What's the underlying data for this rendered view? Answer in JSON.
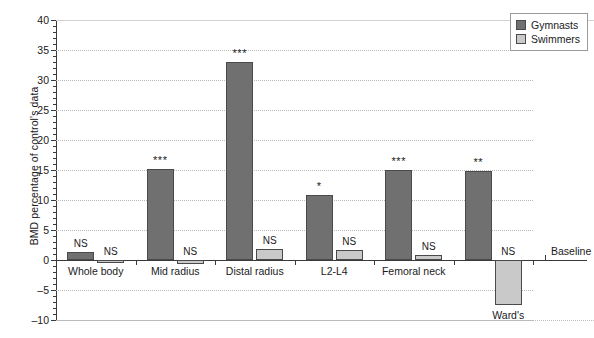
{
  "chart_data": {
    "type": "bar",
    "title": "",
    "xlabel": "",
    "ylabel": "BMD percentage of control's data",
    "ylim": [
      -10,
      40
    ],
    "ytick_step": 5,
    "yticks": [
      40,
      35,
      30,
      25,
      20,
      15,
      10,
      5,
      0,
      -5,
      -10
    ],
    "ytick_labels": [
      "40",
      "35",
      "30",
      "25",
      "20",
      "15",
      "10",
      "5",
      "0",
      "–5",
      "–10"
    ],
    "grid": true,
    "legend_position": "top-right",
    "baseline_label": "Baseline",
    "baseline_value": 0,
    "categories": [
      "Whole body",
      "Mid radius",
      "Distal radius",
      "L2-L4",
      "Femoral neck",
      "Ward's"
    ],
    "series": [
      {
        "name": "Gymnasts",
        "color": "#707070",
        "values": [
          1.3,
          15.2,
          33.0,
          10.9,
          15.0,
          14.8
        ],
        "annotations": [
          "NS",
          "***",
          "***",
          "*",
          "***",
          "**"
        ]
      },
      {
        "name": "Swimmers",
        "color": "#c9c9c9",
        "values": [
          -0.5,
          -0.6,
          1.8,
          1.6,
          0.9,
          -7.5
        ],
        "annotations": [
          "NS",
          "NS",
          "NS",
          "NS",
          "NS",
          "NS"
        ]
      }
    ]
  },
  "legend": {
    "items": [
      {
        "label": "Gymnasts",
        "color": "#707070"
      },
      {
        "label": "Swimmers",
        "color": "#c9c9c9"
      }
    ]
  },
  "axes": {
    "y_title": "BMD percentage of control's data"
  }
}
